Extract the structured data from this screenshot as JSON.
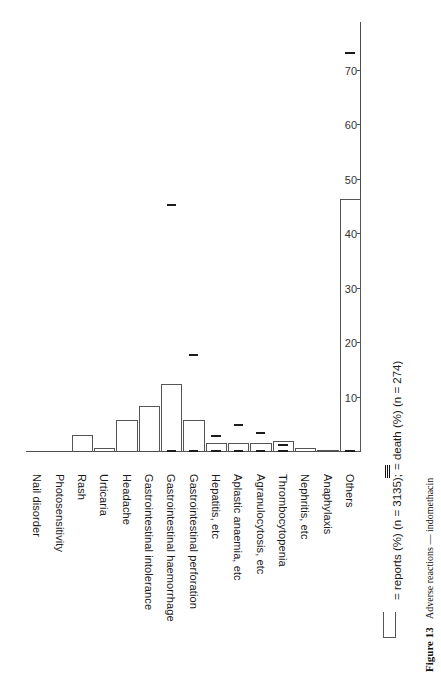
{
  "figure": {
    "caption_label": "Figure 13",
    "caption_text": "Adverse reactions — indomethacin"
  },
  "legend": {
    "reports_label": "= reports (%) (n = 3135);",
    "death_label": "= death (%) (n = 274)",
    "reports_swatch": "open-bar-swatch",
    "death_swatch": "double-line-swatch"
  },
  "chart_data": {
    "type": "bar",
    "orientation": "vertical-rotated",
    "title": "Adverse reactions — indomethacin",
    "xlabel": "",
    "ylabel": "",
    "ylim": [
      0,
      79
    ],
    "ticks": [
      10,
      20,
      30,
      40,
      50,
      60,
      70
    ],
    "grid": false,
    "legend_position": "bottom-right",
    "categories": [
      "Nail disorder",
      "Photosensitivity",
      "Rash",
      "Urticaria",
      "Headache",
      "Gastrointestinal intolerance",
      "Gastrointestinal haemorrhage",
      "Gastrointestinal perforation",
      "Hepatitis, etc",
      "Aplastic anaemia, etc",
      "Agranulocytosis, etc",
      "Thrombocytopenia",
      "Nephritis, etc",
      "Anaphylaxis",
      "Others"
    ],
    "series": [
      {
        "name": "= reports (%) (n = 3135)",
        "values": [
          0,
          0,
          3.2,
          0.8,
          5.8,
          8.5,
          12.5,
          5.8,
          1.6,
          1.6,
          1.6,
          2.0,
          0.8,
          0.4,
          46.5
        ]
      },
      {
        "name": "= death (%) (n = 274)",
        "values": [
          0,
          0,
          0,
          0,
          0,
          0,
          45.5,
          18.0,
          3.2,
          5.2,
          3.6,
          1.4,
          0,
          0,
          73.5
        ]
      }
    ]
  }
}
